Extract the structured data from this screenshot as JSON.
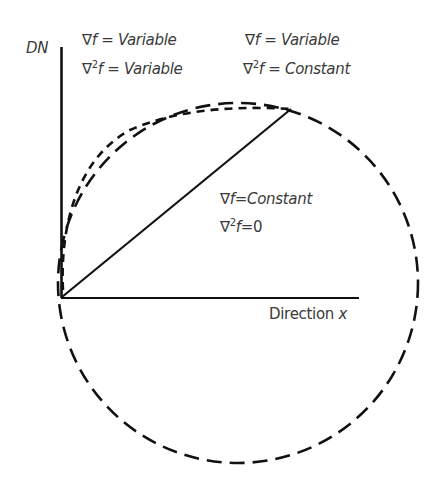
{
  "diagram": {
    "axes": {
      "y_label": "DN",
      "x_label_prefix": "Direction ",
      "x_label_var": "x"
    },
    "annotations": [
      {
        "id": "variable-variable",
        "line1": {
          "op": "∇",
          "sup": "",
          "f": "f",
          "eq": " = ",
          "value": "Variable"
        },
        "line2": {
          "op": "∇",
          "sup": "2",
          "f": "f",
          "eq": " = ",
          "value": "Variable"
        }
      },
      {
        "id": "variable-constant",
        "line1": {
          "op": "∇",
          "sup": "",
          "f": "f",
          "eq": " = ",
          "value": "Variable"
        },
        "line2": {
          "op": "∇",
          "sup": "2",
          "f": "f",
          "eq": " = ",
          "value": "Constant"
        }
      },
      {
        "id": "constant-zero",
        "line1": {
          "op": "∇",
          "sup": "",
          "f": "f",
          "eq": "=",
          "value": "Constant"
        },
        "line2": {
          "op": "∇",
          "sup": "2",
          "f": "f",
          "eq": "=",
          "value": "0"
        }
      }
    ],
    "curves": [
      {
        "name": "straight-line",
        "style": "solid",
        "meaning": "∇f=Constant, ∇²f=0"
      },
      {
        "name": "short-dash-curve",
        "style": "short-dashed",
        "meaning": "∇f=Variable, ∇²f=Variable"
      },
      {
        "name": "circle-arc",
        "style": "long-dashed",
        "meaning": "∇f=Variable, ∇²f=Constant"
      }
    ],
    "colors": {
      "line": "#111111",
      "text": "#3a3a3a",
      "background": "#ffffff"
    }
  }
}
